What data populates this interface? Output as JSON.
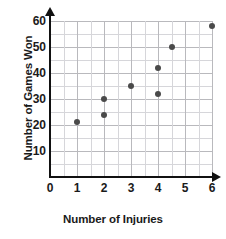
{
  "chart_data": {
    "type": "scatter",
    "title": "",
    "xlabel": "Number of Injuries",
    "ylabel": "Number of Games Won",
    "xlim": [
      0,
      6
    ],
    "ylim": [
      0,
      60
    ],
    "grid": true,
    "legend": null,
    "x_ticks": [
      "0",
      "1",
      "2",
      "3",
      "4",
      "5",
      "6"
    ],
    "y_ticks": [
      "10",
      "20",
      "30",
      "40",
      "50",
      "60"
    ],
    "x_tick_values": [
      0,
      1,
      2,
      3,
      4,
      5,
      6
    ],
    "y_tick_values": [
      10,
      20,
      30,
      40,
      50,
      60
    ],
    "x_minor_step": 0.5,
    "y_minor_step": 5,
    "points": [
      {
        "x": 1,
        "y": 21
      },
      {
        "x": 2,
        "y": 24
      },
      {
        "x": 2,
        "y": 30
      },
      {
        "x": 3,
        "y": 35
      },
      {
        "x": 4,
        "y": 32
      },
      {
        "x": 4,
        "y": 42
      },
      {
        "x": 4.5,
        "y": 50
      },
      {
        "x": 6,
        "y": 58
      }
    ],
    "point_color": "#4a4a4a",
    "grid_color": "#b9b9bd",
    "axis_color": "#111111"
  }
}
